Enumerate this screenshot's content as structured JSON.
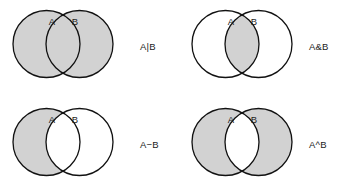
{
  "figure": {
    "colors": {
      "fill": "#d2d2d2",
      "stroke": "#111111",
      "background": "#ffffff",
      "text": "#1c1c1c"
    },
    "geometry": {
      "circle_radius": 33.5,
      "left_circle_cx": 46.5,
      "right_circle_cx": 79.5,
      "circle_cy": 44,
      "stroke_width": 1.3
    }
  },
  "panels": [
    {
      "id": "union",
      "operation": "A|B",
      "expression_label": "A|B",
      "set_a_label": "A",
      "set_b_label": "B",
      "shaded": "both-circles-including-intersection"
    },
    {
      "id": "intersection",
      "operation": "A&B",
      "expression_label": "A&B",
      "set_a_label": "A",
      "set_b_label": "B",
      "shaded": "intersection-only"
    },
    {
      "id": "difference",
      "operation": "A-B",
      "expression_label": "A−B",
      "set_a_label": "A",
      "set_b_label": "B",
      "shaded": "a-minus-b"
    },
    {
      "id": "symmetric-difference",
      "operation": "A^B",
      "expression_label": "A^B",
      "set_a_label": "A",
      "set_b_label": "B",
      "shaded": "symmetric-difference"
    }
  ]
}
